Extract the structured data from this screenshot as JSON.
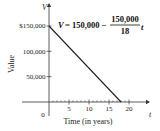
{
  "chart_data": {
    "type": "line",
    "title": "",
    "xlabel": "Time (in years)",
    "ylabel": "Value",
    "x_axis_var": "t",
    "y_axis_var": "V",
    "xlim": [
      0,
      20
    ],
    "ylim": [
      0,
      150000
    ],
    "x_ticks": [
      0,
      5,
      10,
      15,
      20
    ],
    "x_tick_labels": [
      "0",
      "5",
      "10",
      "15",
      "20"
    ],
    "x_minor_tick_step": 1,
    "y_ticks": [
      50000,
      100000,
      150000
    ],
    "y_tick_labels": [
      "50,000",
      "100,000",
      "$150,000"
    ],
    "grid": false,
    "series": [
      {
        "name": "V = 150,000 - (150,000/18) t",
        "x": [
          0,
          18
        ],
        "y": [
          150000,
          0
        ],
        "color": "#222222"
      }
    ],
    "annotation": {
      "lhs": "V",
      "equals": "= 150,000 −",
      "numerator": "150,000",
      "denominator": "18",
      "var": "t"
    }
  }
}
